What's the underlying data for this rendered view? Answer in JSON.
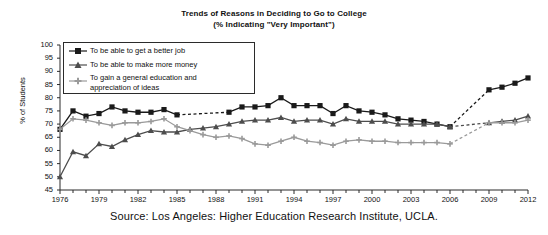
{
  "title": {
    "line1": "Trends of Reasons in Deciding to Go to College",
    "line2": "(% Indicating \"Very Important\")"
  },
  "source": "Source: Los Angeles: Higher Education Research Institute, UCLA.",
  "axes": {
    "ylabel": "% of Students",
    "yticks": [
      "100",
      "95",
      "90",
      "85",
      "80",
      "75",
      "70",
      "65",
      "60",
      "55",
      "50",
      "45"
    ],
    "xticks": [
      "1976",
      "1979",
      "1982",
      "1985",
      "1988",
      "1991",
      "1994",
      "1997",
      "2000",
      "2003",
      "2006",
      "2009",
      "2012"
    ]
  },
  "legend": {
    "items": [
      {
        "label": "To be able to get a better job",
        "marker": "filled-square-marker",
        "color": "#1a1a1a"
      },
      {
        "label": "To be able to make more money",
        "marker": "filled-triangle-marker",
        "color": "#4d4d4d"
      },
      {
        "label_line1": "To gain a general education and",
        "label_line2": "appreciation of ideas",
        "marker": "small-plus-marker",
        "color": "#9a9a9a"
      }
    ]
  },
  "chart_data": {
    "type": "line",
    "title": "Trends of Reasons in Deciding to Go to College (% Indicating \"Very Important\")",
    "xlabel": "",
    "ylabel": "% of Students",
    "ylim": [
      45,
      100
    ],
    "xlim": [
      1976,
      2012
    ],
    "grid": false,
    "legend_position": "upper-left-inside",
    "x": [
      1976,
      1977,
      1978,
      1979,
      1980,
      1981,
      1982,
      1983,
      1984,
      1985,
      1986,
      1987,
      1988,
      1989,
      1990,
      1991,
      1992,
      1993,
      1994,
      1995,
      1996,
      1997,
      1998,
      1999,
      2000,
      2001,
      2002,
      2003,
      2004,
      2005,
      2006,
      2007,
      2008,
      2009,
      2010,
      2011,
      2012
    ],
    "series": [
      {
        "name": "To be able to get a better job",
        "color": "#1a1a1a",
        "marker": "square",
        "values": [
          68,
          75,
          73,
          74,
          76.5,
          75,
          74.5,
          74.5,
          75.5,
          73.5,
          null,
          null,
          null,
          74.5,
          76.5,
          76.5,
          77,
          80,
          77,
          77,
          77,
          74,
          77,
          75,
          74.5,
          73.5,
          72,
          71.5,
          71,
          70,
          69,
          null,
          null,
          83,
          84,
          85.5,
          87.5
        ],
        "gap_segments": [
          [
            1985,
            1989
          ],
          [
            2006,
            2009
          ]
        ]
      },
      {
        "name": "To be able to make more money",
        "color": "#4d4d4d",
        "marker": "triangle",
        "values": [
          50,
          59.5,
          58,
          62.5,
          61.5,
          64,
          66,
          67.5,
          67,
          67,
          68,
          68.5,
          69,
          70,
          71,
          71.5,
          71.5,
          72.5,
          71,
          71.5,
          71.5,
          70,
          72,
          71,
          71,
          71,
          70,
          70,
          70,
          70,
          69,
          null,
          null,
          70.5,
          71,
          71.5,
          73
        ],
        "gap_segments": [
          [
            2006,
            2009
          ]
        ]
      },
      {
        "name": "To gain a general education and appreciation of ideas",
        "color": "#9a9a9a",
        "marker": "plus",
        "values": [
          68,
          72,
          71.5,
          70.5,
          69.5,
          70.5,
          70.5,
          71,
          72,
          69,
          67.5,
          66,
          65,
          65.5,
          64.5,
          62.5,
          62,
          63.5,
          65,
          63.5,
          63,
          62,
          63.5,
          64,
          63.5,
          63.5,
          63,
          63,
          63,
          63,
          62.5,
          null,
          null,
          70.5,
          70.5,
          70.5,
          71.5
        ],
        "gap_segments": [
          [
            2006,
            2009
          ]
        ]
      }
    ]
  }
}
